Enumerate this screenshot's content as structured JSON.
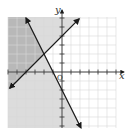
{
  "graph": {
    "type": "system-of-linear-inequalities",
    "x_axis_label": "x",
    "y_axis_label": "y",
    "origin_label": "O",
    "grid": {
      "x_min": -6,
      "x_max": 6,
      "y_min": -6,
      "y_max": 6,
      "step": 1
    },
    "colors": {
      "background": "#ffffff",
      "grid_line": "#d8d8d8",
      "light_shade": "#dcdcdc",
      "dark_shade": "#b8b8b8",
      "line": "#1a1a1a",
      "axis": "#333333"
    },
    "lines": [
      {
        "name": "increasing-boundary-line",
        "slope": 1,
        "y_intercept": 4,
        "style": "solid",
        "shaded_side": "above"
      },
      {
        "name": "decreasing-boundary-line",
        "slope": -2,
        "y_intercept": -2,
        "style": "solid",
        "shaded_side": "left"
      }
    ],
    "intersection": {
      "x": -2,
      "y": 2
    }
  }
}
